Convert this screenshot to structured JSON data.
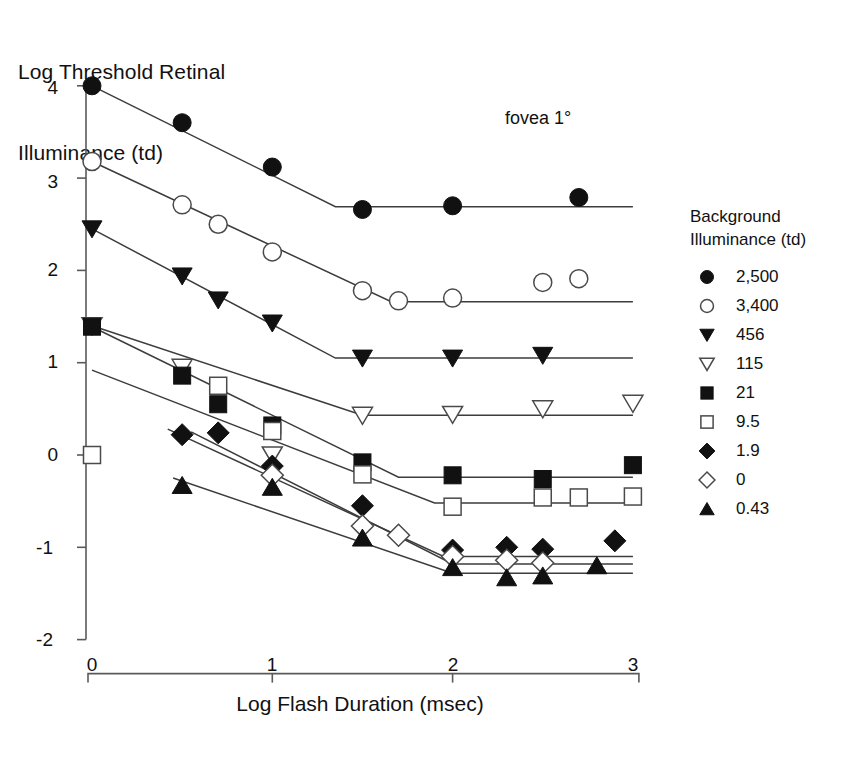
{
  "chart_data": {
    "type": "scatter",
    "title": "",
    "xlabel": "Log Flash Duration (msec)",
    "ylabel_line1": "Log Threshold Retinal",
    "ylabel_line2": "Illuminance (td)",
    "annotation": "fovea 1°",
    "legend_title_line1": "Background",
    "legend_title_line2": "Illuminance (td)",
    "legend_position": "right",
    "grid": false,
    "xlim": [
      0,
      3
    ],
    "ylim": [
      -2,
      4
    ],
    "xticks": [
      0,
      1,
      2,
      3
    ],
    "xtick_labels": [
      "0",
      "1",
      "2",
      "3"
    ],
    "yticks": [
      -2,
      -1,
      0,
      1,
      2,
      3,
      4
    ],
    "ytick_labels": [
      "-2",
      "-1",
      "0",
      "1",
      "2",
      "3",
      "4"
    ],
    "series": [
      {
        "name": "2,500",
        "marker": "filled-circle",
        "x": [
          0.0,
          0.5,
          1.0,
          1.5,
          2.0,
          2.7
        ],
        "y": [
          4.0,
          3.6,
          3.12,
          2.66,
          2.7,
          2.79
        ],
        "fit": {
          "x": [
            0.0,
            1.35,
            3.0
          ],
          "y": [
            4.0,
            2.69,
            2.69
          ]
        }
      },
      {
        "name": "3,400",
        "marker": "open-circle",
        "x": [
          0.0,
          0.5,
          0.7,
          1.0,
          1.5,
          1.7,
          2.0,
          2.5,
          2.7
        ],
        "y": [
          3.18,
          2.71,
          2.5,
          2.2,
          1.78,
          1.67,
          1.7,
          1.87,
          1.91
        ],
        "fit": {
          "x": [
            0.0,
            1.66,
            3.0
          ],
          "y": [
            3.18,
            1.66,
            1.66
          ]
        }
      },
      {
        "name": "456",
        "marker": "filled-triangle-down",
        "x": [
          0.0,
          0.5,
          0.7,
          1.0,
          1.5,
          2.0,
          2.5
        ],
        "y": [
          2.45,
          1.94,
          1.68,
          1.43,
          1.05,
          1.05,
          1.08
        ],
        "fit": {
          "x": [
            0.0,
            1.35,
            3.0
          ],
          "y": [
            2.45,
            1.05,
            1.05
          ]
        }
      },
      {
        "name": "115",
        "marker": "open-triangle-down",
        "x": [
          0.0,
          0.5,
          1.0,
          1.5,
          2.0,
          2.5,
          3.0
        ],
        "y": [
          1.4,
          0.95,
          0.0,
          0.43,
          0.44,
          0.5,
          0.56
        ],
        "fit": {
          "x": [
            0.0,
            1.5,
            3.0
          ],
          "y": [
            1.4,
            0.43,
            0.43
          ]
        }
      },
      {
        "name": "21",
        "marker": "filled-square",
        "x": [
          0.0,
          0.5,
          0.7,
          1.0,
          1.5,
          2.0,
          2.5,
          3.0
        ],
        "y": [
          1.39,
          0.86,
          0.55,
          0.32,
          -0.08,
          -0.22,
          -0.26,
          -0.11
        ],
        "fit": {
          "x": [
            0.0,
            1.7,
            3.0
          ],
          "y": [
            1.39,
            -0.24,
            -0.24
          ]
        }
      },
      {
        "name": "9.5",
        "marker": "open-square",
        "x": [
          0.0,
          0.7,
          1.0,
          1.5,
          2.0,
          2.5,
          2.7,
          3.0
        ],
        "y": [
          0.0,
          0.75,
          0.26,
          -0.21,
          -0.56,
          -0.46,
          -0.46,
          -0.45
        ],
        "fit": {
          "x": [
            0.0,
            1.9,
            3.0
          ],
          "y": [
            0.92,
            -0.52,
            -0.52
          ]
        }
      },
      {
        "name": "1.9",
        "marker": "filled-diamond",
        "x": [
          0.5,
          0.7,
          1.0,
          1.5,
          2.0,
          2.3,
          2.5,
          2.9
        ],
        "y": [
          0.22,
          0.24,
          -0.12,
          -0.55,
          -1.03,
          -1.0,
          -1.02,
          -0.93
        ],
        "fit": {
          "x": [
            0.42,
            1.95,
            3.0
          ],
          "y": [
            0.28,
            -1.1,
            -1.1
          ]
        }
      },
      {
        "name": "0",
        "marker": "open-diamond",
        "x": [
          1.0,
          1.5,
          1.7,
          2.0,
          2.3,
          2.5
        ],
        "y": [
          -0.22,
          -0.77,
          -0.87,
          -1.1,
          -1.14,
          -1.17
        ],
        "fit": {
          "x": [
            0.55,
            2.0,
            3.0
          ],
          "y": [
            0.25,
            -1.18,
            -1.18
          ]
        }
      },
      {
        "name": "0.43",
        "marker": "filled-triangle-up",
        "x": [
          0.5,
          1.0,
          1.5,
          2.0,
          2.3,
          2.5,
          2.8
        ],
        "y": [
          -0.33,
          -0.35,
          -0.9,
          -1.22,
          -1.33,
          -1.31,
          -1.2
        ],
        "fit": {
          "x": [
            0.45,
            2.0,
            3.0
          ],
          "y": [
            -0.25,
            -1.28,
            -1.28
          ]
        }
      }
    ]
  }
}
